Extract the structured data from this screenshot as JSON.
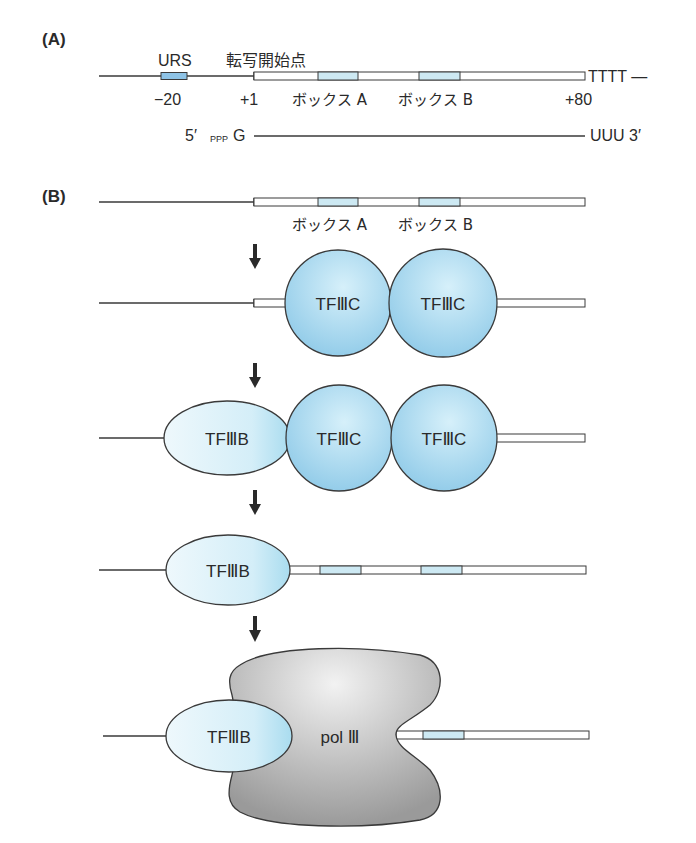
{
  "panel_a": {
    "label": "(A)",
    "urs_label": "URS",
    "tss_label": "転写開始点",
    "pos_urs": "−20",
    "pos_start": "+1",
    "box_a": "ボックス A",
    "box_b": "ボックス B",
    "pos_end": "+80",
    "terminator": "TTTT —",
    "rna_5": "5′",
    "rna_ppp": "PPP",
    "rna_g": "G",
    "rna_3": "UUU 3′"
  },
  "panel_b": {
    "label": "(B)",
    "row1": {
      "box_a": "ボックス A",
      "box_b": "ボックス B"
    },
    "row2": {
      "factor1": "TFⅢC",
      "factor2": "TFⅢC"
    },
    "row3": {
      "factor_b": "TFⅢB",
      "factor1": "TFⅢC",
      "factor2": "TFⅢC"
    },
    "row4": {
      "factor_b": "TFⅢB"
    },
    "row5": {
      "factor_b": "TFⅢB",
      "polymerase": "pol Ⅲ"
    }
  },
  "colors": {
    "box_fill": "#cde9f3",
    "urs_fill": "#8ec3e6",
    "tfiiic_fill": "#9fd3ec",
    "tfiiib_fill": "#d9f0f8",
    "pol_fill": "#b8b8b8",
    "stroke": "#3a3a3a"
  }
}
